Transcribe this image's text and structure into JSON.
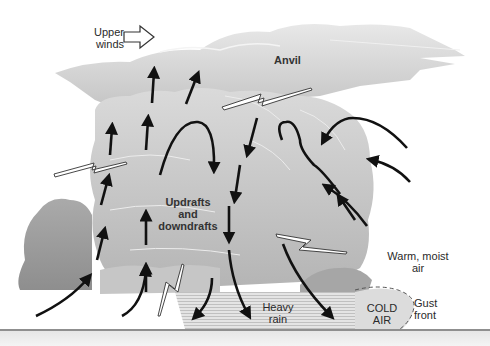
{
  "diagram": {
    "labels": {
      "upper_winds": [
        "Upper",
        "winds"
      ],
      "anvil": "Anvil",
      "updrafts": [
        "Updrafts",
        "and",
        "downdrafts"
      ],
      "warm_air": [
        "Warm, moist",
        "air"
      ],
      "heavy_rain": [
        "Heavy",
        "rain"
      ],
      "cold_air": [
        "COLD",
        "AIR"
      ],
      "gust_front": [
        "Gust",
        "front"
      ]
    },
    "icons": {
      "upper_winds_arrow": "outline-right-arrow",
      "lightning": "lightning-bolt",
      "airflow": "curved-arrow"
    },
    "colors": {
      "cloud_light": "#e2e2e2",
      "cloud_mid": "#c8c8c8",
      "cloud_dark": "#9c9c9c",
      "arrow": "#111111",
      "rain": "#d4d4d4",
      "cold_air": "#dcdcdc",
      "ground": "#6a6a6a"
    }
  }
}
